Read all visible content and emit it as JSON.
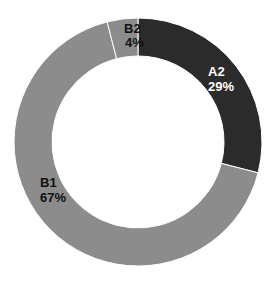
{
  "chart_data": {
    "type": "pie",
    "donut": true,
    "title": "",
    "categories": [
      "A2",
      "B1",
      "B2"
    ],
    "values": [
      29,
      67,
      4
    ],
    "labels": [
      "A2\n29%",
      "B1\n67%",
      "B2\n4%"
    ],
    "colors": [
      "#2b2b2b",
      "#8c8c8c",
      "#8c8c8c"
    ],
    "label_colors": [
      "#ffffff",
      "#111111",
      "#111111"
    ],
    "start_angle_deg": 0,
    "direction": "clockwise",
    "legend": "none"
  },
  "labels": {
    "a2_name": "A2",
    "a2_pct": "29%",
    "b1_name": "B1",
    "b1_pct": "67%",
    "b2_name": "B2",
    "b2_pct": "4%"
  }
}
